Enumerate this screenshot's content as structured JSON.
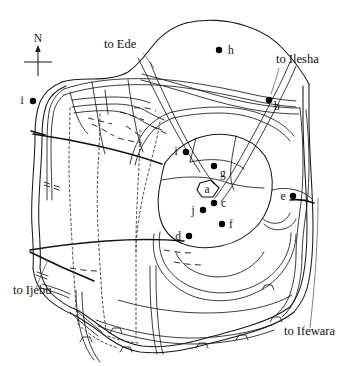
{
  "figure": {
    "kind": "hand-drawn-line-map",
    "background_color": "#ffffff",
    "ink_color": "#111111",
    "width": 354,
    "height": 366
  },
  "compass": {
    "label": "N",
    "icon": "north-arrow-icon",
    "x": 38,
    "y": 33
  },
  "route_labels": [
    {
      "id": "ede",
      "text": "to Ede",
      "x": 104,
      "y": 48,
      "anchor": "start"
    },
    {
      "id": "ilesha",
      "text": "to Ilesha",
      "x": 276,
      "y": 63,
      "anchor": "start"
    },
    {
      "id": "ijebu",
      "text": "to Ijebu",
      "x": 13,
      "y": 294,
      "anchor": "start"
    },
    {
      "id": "ifewara",
      "text": "to Ifewara",
      "x": 284,
      "y": 335,
      "anchor": "start"
    }
  ],
  "sites": [
    {
      "id": "i-west",
      "label": "i",
      "dot_x": 33,
      "dot_y": 101,
      "label_x": 22,
      "label_y": 104
    },
    {
      "id": "h",
      "label": "h",
      "dot_x": 219,
      "dot_y": 50,
      "label_x": 228,
      "label_y": 54
    },
    {
      "id": "b",
      "label": "b",
      "dot_x": 269,
      "dot_y": 100,
      "label_x": 274,
      "label_y": 108
    },
    {
      "id": "i-center",
      "label": "i",
      "dot_x": 186,
      "dot_y": 152,
      "label_x": 176,
      "label_y": 155
    },
    {
      "id": "g",
      "label": "g",
      "dot_x": 214,
      "dot_y": 166,
      "label_x": 220,
      "label_y": 175
    },
    {
      "id": "a",
      "label": "a",
      "dot_x": null,
      "dot_y": null,
      "label_x": 203,
      "label_y": 194
    },
    {
      "id": "c",
      "label": "c",
      "dot_x": 214,
      "dot_y": 203,
      "label_x": 220,
      "label_y": 207
    },
    {
      "id": "j",
      "label": "j",
      "dot_x": 203,
      "dot_y": 210,
      "label_x": 192,
      "label_y": 213
    },
    {
      "id": "f",
      "label": "f",
      "dot_x": 222,
      "dot_y": 224,
      "label_x": 228,
      "label_y": 228
    },
    {
      "id": "d",
      "label": "d",
      "dot_x": 189,
      "dot_y": 236,
      "label_x": 177,
      "label_y": 239
    },
    {
      "id": "e",
      "label": "e",
      "dot_x": 293,
      "dot_y": 196,
      "label_x": 282,
      "label_y": 199
    }
  ],
  "features": {
    "palace_enclosure": "small-polygon-around-site-a",
    "ring_roads": 3,
    "radial_roads": 6,
    "dotted_paths": 4
  }
}
